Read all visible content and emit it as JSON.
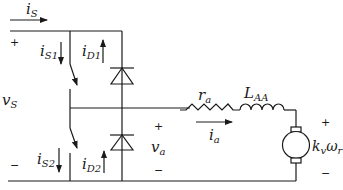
{
  "diagram": {
    "type": "circuit-schematic",
    "colors": {
      "wire": "#1a1a1a",
      "background": "#ffffff"
    },
    "source": {
      "voltage_label": {
        "main": "v",
        "sub": "S"
      },
      "current_label": {
        "main": "i",
        "sub": "S"
      },
      "plus": "+",
      "minus": "−"
    },
    "switches": [
      {
        "id": "S1",
        "current_label": {
          "main": "i",
          "sub": "S1"
        },
        "current_direction": "down"
      },
      {
        "id": "S2",
        "current_label": {
          "main": "i",
          "sub": "S2"
        },
        "current_direction": "down"
      }
    ],
    "diodes": [
      {
        "id": "D1",
        "current_label": {
          "main": "i",
          "sub": "D1"
        },
        "current_direction": "up"
      },
      {
        "id": "D2",
        "current_label": {
          "main": "i",
          "sub": "D2"
        },
        "current_direction": "up"
      }
    ],
    "output": {
      "voltage_label": {
        "main": "v",
        "sub": "a"
      },
      "plus": "+",
      "minus": "−"
    },
    "load": {
      "resistor": {
        "main": "r",
        "sub": "a"
      },
      "inductor": {
        "main": "L",
        "sub": "AA"
      },
      "armature_current": {
        "main": "i",
        "sub": "a"
      },
      "back_emf": {
        "k": "k",
        "k_sub": "v",
        "omega": "ω",
        "omega_sub": "r"
      },
      "plus": "+",
      "minus": "−"
    }
  }
}
